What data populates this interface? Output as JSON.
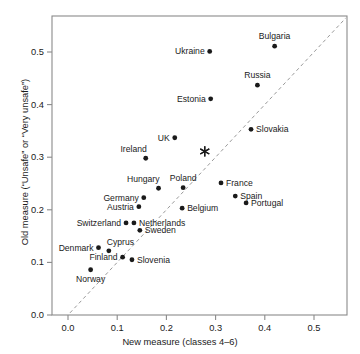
{
  "chart_data": {
    "type": "scatter",
    "title": "",
    "xlabel": "New measure (classes 4–6)",
    "ylabel": "Old measure (“Unsafe” or “Very unsafe”)",
    "xlim": [
      -0.015,
      0.565
    ],
    "ylim": [
      -0.012,
      0.565
    ],
    "xticks": [
      0.0,
      0.1,
      0.2,
      0.3,
      0.4,
      0.5
    ],
    "xticklabels": [
      "0.0",
      "0.1",
      "0.2",
      "0.3",
      "0.4",
      "0.5"
    ],
    "yticks": [
      0.0,
      0.1,
      0.2,
      0.3,
      0.4,
      0.5
    ],
    "yticklabels": [
      "0.0",
      "0.1",
      "0.2",
      "0.3",
      "0.4",
      "0.5"
    ],
    "grid": false,
    "legend": null,
    "reference_line": {
      "type": "identity",
      "style": "dashed",
      "x": [
        -0.005,
        0.565
      ],
      "y": [
        -0.005,
        0.565
      ]
    },
    "marker": "filled-circle",
    "marker_color": "#1a1a1a",
    "points": [
      {
        "label": "Bulgaria",
        "x": 0.42,
        "y": 0.511,
        "label_pos": "above"
      },
      {
        "label": "Ukraine",
        "x": 0.288,
        "y": 0.501,
        "label_pos": "left"
      },
      {
        "label": "Russia",
        "x": 0.385,
        "y": 0.437,
        "label_pos": "above"
      },
      {
        "label": "Estonia",
        "x": 0.29,
        "y": 0.411,
        "label_pos": "left"
      },
      {
        "label": "Slovakia",
        "x": 0.372,
        "y": 0.353,
        "label_pos": "right"
      },
      {
        "label": "UK",
        "x": 0.217,
        "y": 0.337,
        "label_pos": "left"
      },
      {
        "label": "Ireland",
        "x": 0.158,
        "y": 0.298,
        "label_pos": "above-left"
      },
      {
        "label": "France",
        "x": 0.311,
        "y": 0.251,
        "label_pos": "right"
      },
      {
        "label": "Poland",
        "x": 0.234,
        "y": 0.242,
        "label_pos": "above"
      },
      {
        "label": "Hungary",
        "x": 0.184,
        "y": 0.241,
        "label_pos": "above-left"
      },
      {
        "label": "Spain",
        "x": 0.34,
        "y": 0.226,
        "label_pos": "right"
      },
      {
        "label": "Germany",
        "x": 0.154,
        "y": 0.223,
        "label_pos": "left"
      },
      {
        "label": "Portugal",
        "x": 0.362,
        "y": 0.213,
        "label_pos": "right"
      },
      {
        "label": "Austria",
        "x": 0.144,
        "y": 0.206,
        "label_pos": "left"
      },
      {
        "label": "Belgium",
        "x": 0.232,
        "y": 0.203,
        "label_pos": "right"
      },
      {
        "label": "Switzerland",
        "x": 0.118,
        "y": 0.175,
        "label_pos": "left"
      },
      {
        "label": "Netherlands",
        "x": 0.134,
        "y": 0.175,
        "label_pos": "right"
      },
      {
        "label": "Sweden",
        "x": 0.146,
        "y": 0.161,
        "label_pos": "right"
      },
      {
        "label": "Denmark",
        "x": 0.062,
        "y": 0.128,
        "label_pos": "left"
      },
      {
        "label": "Cyprus",
        "x": 0.083,
        "y": 0.122,
        "label_pos": "above-right"
      },
      {
        "label": "Finland",
        "x": 0.111,
        "y": 0.11,
        "label_pos": "left"
      },
      {
        "label": "Slovenia",
        "x": 0.13,
        "y": 0.105,
        "label_pos": "right"
      },
      {
        "label": "Norway",
        "x": 0.046,
        "y": 0.086,
        "label_pos": "below"
      }
    ],
    "special_markers": [
      {
        "marker": "asterisk",
        "x": 0.278,
        "y": 0.311,
        "label": ""
      }
    ]
  }
}
